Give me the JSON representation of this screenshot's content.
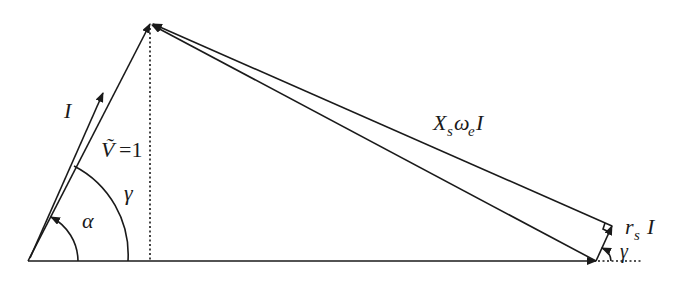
{
  "diagram": {
    "type": "phasor-diagram",
    "labels": {
      "current": "I",
      "voltage_symbol": "Ṽ",
      "voltage_value": "=1",
      "reactance_drop_X": "X",
      "reactance_drop_sub_s": "s",
      "reactance_drop_omega": "ω",
      "reactance_drop_sub_e": "e",
      "reactance_drop_I": "I",
      "resistance_drop_r": "r",
      "resistance_drop_sub_s": "s",
      "resistance_drop_I": "I",
      "angle_alpha": "α",
      "angle_gamma": "γ",
      "angle_gamma_small": "γ"
    },
    "points": {
      "origin": [
        28,
        261
      ],
      "apex": [
        150,
        24
      ],
      "current_tip": [
        103,
        93
      ],
      "base_end": [
        596,
        261
      ],
      "rs_tip": [
        612,
        226
      ]
    },
    "colors": {
      "stroke": "#1a1a1a",
      "background": "#ffffff"
    }
  }
}
